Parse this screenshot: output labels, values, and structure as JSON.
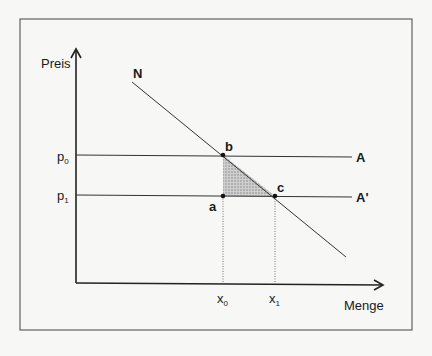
{
  "diagram": {
    "y_axis_label": "Preis",
    "x_axis_label": "Menge",
    "demand_label": "N",
    "supply_label_old": "A",
    "supply_label_new": "A'",
    "price_old": "p",
    "price_old_sub": "0",
    "price_new": "p",
    "price_new_sub": "1",
    "qty_old": "x",
    "qty_old_sub": "0",
    "qty_new": "x",
    "qty_new_sub": "1",
    "point_a": "a",
    "point_b": "b",
    "point_c": "c",
    "colors": {
      "line": "#2a2a2a",
      "shade": "#b8b8b8",
      "frame": "#444444"
    }
  }
}
